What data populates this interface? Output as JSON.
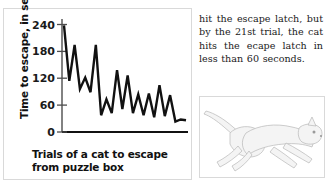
{
  "figure": {
    "ylabel": "Time to escape, in seconds",
    "xlabel_line1": "Trials of a cat to escape",
    "xlabel_line2": "from puzzle box",
    "axis_color": "#4d4d4d",
    "line_color": "#111111"
  },
  "body_text": "hit the escape latch, but by the 21st trial, the cat hits the ecape latch in less than 60 seconds.",
  "illustration": {
    "name": "leaping-cat",
    "fill": "#f2f2f2",
    "stroke": "#b5b5b5"
  },
  "chart_data": {
    "type": "line",
    "title": "",
    "xlabel": "Trials of a cat to escape from puzzle box",
    "ylabel": "Time to escape, in seconds",
    "xlim": [
      1,
      24
    ],
    "ylim": [
      0,
      270
    ],
    "yticks": [
      0,
      60,
      120,
      180,
      240
    ],
    "ytick_labels": [
      "0",
      "60",
      "120",
      "180",
      "240"
    ],
    "xticks": [],
    "grid": false,
    "legend": false,
    "x": [
      1,
      2,
      3,
      4,
      5,
      6,
      7,
      8,
      9,
      10,
      11,
      12,
      13,
      14,
      15,
      16,
      17,
      18,
      19,
      20,
      21,
      22,
      23,
      24
    ],
    "values": [
      255,
      122,
      208,
      103,
      130,
      95,
      208,
      40,
      78,
      45,
      148,
      55,
      135,
      45,
      90,
      40,
      92,
      35,
      112,
      38,
      88,
      25,
      30,
      28
    ],
    "series": [
      {
        "name": "Time to escape",
        "values": [
          255,
          122,
          208,
          103,
          130,
          95,
          208,
          40,
          78,
          45,
          148,
          55,
          135,
          45,
          90,
          40,
          92,
          35,
          112,
          38,
          88,
          25,
          30,
          28
        ]
      }
    ]
  }
}
